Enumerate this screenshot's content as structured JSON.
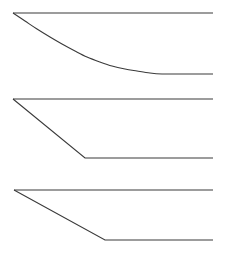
{
  "figure": {
    "title": "",
    "background_color": "#ffffff",
    "width": 233,
    "height": 260,
    "stroke_color": "#3a3a3a",
    "stroke_color_light": "#555555",
    "stroke_width": 1.1
  },
  "chart_data": {
    "type": "line",
    "title": "",
    "subtitle": "",
    "xlabel": "",
    "ylabel": "",
    "xlim": [
      0,
      233
    ],
    "ylim": [
      260,
      0
    ],
    "grid": false,
    "legend": null,
    "axes_visible": false,
    "tick_labels": [],
    "annotations": [],
    "panels": [
      {
        "name": "panel-1-exponential-decay",
        "index": 1,
        "shape": "smooth-convex-decay",
        "baseline_y": 13,
        "floor_y": 74,
        "start_x": 13,
        "end_x": 213,
        "series": [
          {
            "name": "upper-baseline",
            "kind": "horizontal",
            "points": [
              [
                13,
                13
              ],
              [
                213,
                13
              ]
            ]
          },
          {
            "name": "decay-curve",
            "kind": "curve",
            "points": [
              [
                13,
                13
              ],
              [
                25,
                21
              ],
              [
                37,
                29
              ],
              [
                50,
                37
              ],
              [
                62,
                44
              ],
              [
                75,
                51
              ],
              [
                87,
                57
              ],
              [
                100,
                62
              ],
              [
                112,
                66
              ],
              [
                125,
                69
              ],
              [
                137,
                71
              ],
              [
                150,
                73
              ],
              [
                162,
                74
              ],
              [
                175,
                74
              ],
              [
                188,
                74
              ],
              [
                200,
                74
              ],
              [
                213,
                74
              ]
            ]
          }
        ]
      },
      {
        "name": "panel-2-steep-linear-ramp",
        "index": 2,
        "shape": "piecewise-linear-steep",
        "baseline_y": 99,
        "floor_y": 158,
        "start_x": 13,
        "knee_x": 85,
        "end_x": 213,
        "series": [
          {
            "name": "upper-baseline",
            "kind": "horizontal",
            "points": [
              [
                13,
                99
              ],
              [
                213,
                99
              ]
            ]
          },
          {
            "name": "ramp-line",
            "kind": "polyline",
            "points": [
              [
                13,
                99
              ],
              [
                85,
                158
              ],
              [
                213,
                158
              ]
            ]
          }
        ]
      },
      {
        "name": "panel-3-shallow-linear-ramp",
        "index": 3,
        "shape": "piecewise-linear-shallow",
        "baseline_y": 190,
        "floor_y": 240,
        "start_x": 14,
        "knee_x": 105,
        "end_x": 213,
        "series": [
          {
            "name": "upper-baseline",
            "kind": "horizontal",
            "points": [
              [
                14,
                190
              ],
              [
                213,
                190
              ]
            ]
          },
          {
            "name": "ramp-line",
            "kind": "polyline",
            "points": [
              [
                14,
                190
              ],
              [
                105,
                240
              ],
              [
                213,
                240
              ]
            ]
          }
        ]
      }
    ]
  }
}
